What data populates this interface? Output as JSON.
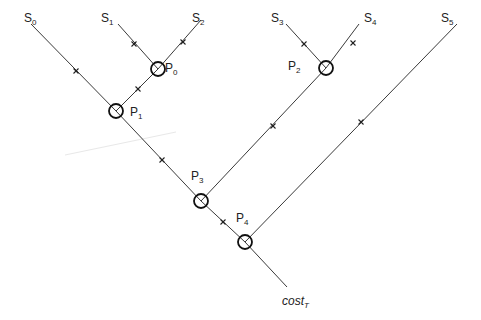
{
  "diagram": {
    "type": "tree-aggregation",
    "sources": [
      {
        "id": "S0",
        "base": "S",
        "sub": "0",
        "x": 24,
        "y": 12
      },
      {
        "id": "S1",
        "base": "S",
        "sub": "1",
        "x": 101,
        "y": 12
      },
      {
        "id": "S2",
        "base": "S",
        "sub": "2",
        "x": 192,
        "y": 12
      },
      {
        "id": "S3",
        "base": "S",
        "sub": "3",
        "x": 271,
        "y": 12
      },
      {
        "id": "S4",
        "base": "S",
        "sub": "4",
        "x": 364,
        "y": 12
      },
      {
        "id": "S5",
        "base": "S",
        "sub": "5",
        "x": 441,
        "y": 12
      }
    ],
    "nodes": [
      {
        "id": "P0",
        "base": "P",
        "sub": "0",
        "cx": 158,
        "cy": 69,
        "lx": 165,
        "ly": 62
      },
      {
        "id": "P1",
        "base": "P",
        "sub": "1",
        "cx": 116,
        "cy": 111,
        "lx": 130,
        "ly": 106
      },
      {
        "id": "P2",
        "base": "P",
        "sub": "2",
        "cx": 326,
        "cy": 68,
        "lx": 288,
        "ly": 60
      },
      {
        "id": "P3",
        "base": "P",
        "sub": "3",
        "cx": 201,
        "cy": 201,
        "lx": 191,
        "ly": 170
      },
      {
        "id": "P4",
        "base": "P",
        "sub": "4",
        "cx": 245,
        "cy": 242,
        "lx": 236,
        "ly": 212
      }
    ],
    "edges": [
      {
        "from": [
          31,
          24
        ],
        "to": [
          116,
          111
        ],
        "mark": [
          76,
          71
        ]
      },
      {
        "from": [
          118,
          24
        ],
        "to": [
          158,
          69
        ],
        "mark": [
          134,
          44
        ]
      },
      {
        "from": [
          201,
          20
        ],
        "to": [
          158,
          69
        ],
        "mark": [
          183,
          42
        ]
      },
      {
        "from": [
          158,
          69
        ],
        "to": [
          116,
          111
        ],
        "mark": [
          138,
          89
        ]
      },
      {
        "from": [
          116,
          111
        ],
        "to": [
          201,
          201
        ],
        "mark": [
          162,
          160
        ]
      },
      {
        "from": [
          286,
          24
        ],
        "to": [
          326,
          68
        ],
        "mark": [
          304,
          44
        ]
      },
      {
        "from": [
          359,
          24
        ],
        "to": [
          326,
          68
        ],
        "mark": [
          353,
          43
        ]
      },
      {
        "from": [
          326,
          68
        ],
        "to": [
          201,
          201
        ],
        "mark": [
          273,
          126
        ]
      },
      {
        "from": [
          201,
          201
        ],
        "to": [
          245,
          242
        ],
        "mark": [
          223,
          222
        ]
      },
      {
        "from": [
          457,
          24
        ],
        "to": [
          245,
          242
        ],
        "mark": [
          361,
          122
        ]
      },
      {
        "from": [
          245,
          242
        ],
        "to": [
          287,
          287
        ],
        "mark": null
      }
    ],
    "sink": {
      "base": "cost",
      "sub": "T",
      "x": 282,
      "y": 295
    },
    "artifact_line": {
      "from": [
        65,
        155
      ],
      "to": [
        176,
        132
      ],
      "color": "#e8e8e8"
    },
    "colors": {
      "line": "#3a3a3a",
      "circle": "#111111",
      "text": "#222222"
    }
  }
}
